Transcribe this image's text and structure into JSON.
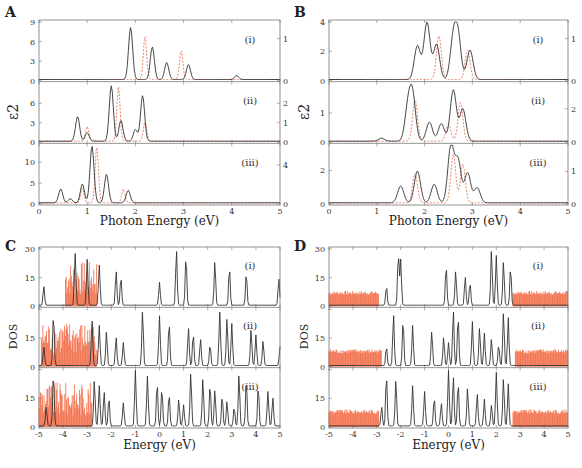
{
  "figure": {
    "panels": {
      "A": {
        "label": "A",
        "xlabel": "Photon Energy (eV)",
        "ylabel": "ε2"
      },
      "B": {
        "label": "B",
        "xlabel": "Photon Energy (eV)",
        "ylabel": "ε2"
      },
      "C": {
        "label": "C",
        "xlabel": "Energy (eV)",
        "ylabel": "DOS"
      },
      "D": {
        "label": "D",
        "xlabel": "Energy (eV)",
        "ylabel": "DOS"
      }
    },
    "sublabels": [
      "(i)",
      "(ii)",
      "(iii)"
    ],
    "colors": {
      "primary_line": "#333333",
      "secondary_line": "#e8775a",
      "dos_fill": "#f0582e"
    }
  },
  "chart_data": [
    {
      "panel": "A",
      "type": "line",
      "xlabel": "Photon Energy (eV)",
      "ylabel": "ε2",
      "xlim": [
        0,
        5
      ],
      "xticks": [
        0,
        1,
        2,
        3,
        4,
        5
      ],
      "subplots": [
        {
          "label": "(i)",
          "left_ylim": [
            0,
            9
          ],
          "left_yticks": [
            0,
            3,
            6,
            9
          ],
          "right_ylim": [
            0,
            1.4
          ],
          "right_yticks": [
            0,
            1
          ],
          "series": [
            {
              "name": "solid (left axis)",
              "style": "solid black",
              "peaks": [
                {
                  "x": 1.9,
                  "y": 8.0
                },
                {
                  "x": 2.35,
                  "y": 5.0
                },
                {
                  "x": 2.65,
                  "y": 2.6
                },
                {
                  "x": 3.1,
                  "y": 2.3
                },
                {
                  "x": 4.1,
                  "y": 0.6
                }
              ]
            },
            {
              "name": "dashed (right axis)",
              "style": "dashed red",
              "peaks": [
                {
                  "x": 2.2,
                  "y": 1.05
                },
                {
                  "x": 2.95,
                  "y": 0.7
                }
              ]
            }
          ]
        },
        {
          "label": "(ii)",
          "left_ylim": [
            0,
            9
          ],
          "left_yticks": [
            0,
            3,
            6
          ],
          "right_ylim": [
            0,
            3
          ],
          "right_yticks": [
            0,
            1,
            2
          ],
          "series": [
            {
              "name": "solid (left axis)",
              "style": "solid black",
              "peaks": [
                {
                  "x": 0.8,
                  "y": 3.8
                },
                {
                  "x": 1.0,
                  "y": 1.3
                },
                {
                  "x": 1.5,
                  "y": 8.5
                },
                {
                  "x": 1.7,
                  "y": 3.2
                },
                {
                  "x": 2.0,
                  "y": 1.8
                },
                {
                  "x": 2.15,
                  "y": 7.0
                }
              ]
            },
            {
              "name": "dashed (right axis)",
              "style": "dashed red",
              "peaks": [
                {
                  "x": 1.0,
                  "y": 0.75
                },
                {
                  "x": 1.65,
                  "y": 2.8
                },
                {
                  "x": 2.2,
                  "y": 1.0
                }
              ]
            }
          ]
        },
        {
          "label": "(iii)",
          "left_ylim": [
            0,
            14
          ],
          "left_yticks": [
            0,
            5,
            10
          ],
          "right_ylim": [
            0,
            6
          ],
          "right_yticks": [
            0,
            4
          ],
          "series": [
            {
              "name": "solid (left axis)",
              "style": "solid black",
              "peaks": [
                {
                  "x": 0.45,
                  "y": 3.3
                },
                {
                  "x": 0.65,
                  "y": 1.0
                },
                {
                  "x": 0.9,
                  "y": 4.5
                },
                {
                  "x": 1.1,
                  "y": 13.5
                },
                {
                  "x": 1.4,
                  "y": 6.8
                },
                {
                  "x": 1.85,
                  "y": 3.0
                }
              ]
            },
            {
              "name": "dashed (right axis)",
              "style": "dashed red",
              "peaks": [
                {
                  "x": 0.9,
                  "y": 1.5
                },
                {
                  "x": 1.2,
                  "y": 5.8
                },
                {
                  "x": 1.75,
                  "y": 1.4
                }
              ]
            }
          ]
        }
      ]
    },
    {
      "panel": "B",
      "type": "line",
      "xlabel": "Photon Energy (eV)",
      "ylabel": "ε2",
      "xlim": [
        0,
        5
      ],
      "xticks": [
        0,
        1,
        2,
        3,
        4,
        5
      ],
      "subplots": [
        {
          "label": "(i)",
          "left_ylim": [
            0,
            4
          ],
          "left_yticks": [
            0,
            2,
            4
          ],
          "right_ylim": [
            0,
            1.4
          ],
          "right_yticks": [
            0,
            1
          ],
          "series": [
            {
              "name": "solid (left axis)",
              "style": "solid black",
              "peaks": [
                {
                  "x": 1.85,
                  "y": 2.3
                },
                {
                  "x": 2.05,
                  "y": 3.9
                },
                {
                  "x": 2.25,
                  "y": 2.4
                },
                {
                  "x": 2.6,
                  "y": 2.7
                },
                {
                  "x": 2.7,
                  "y": 2.8
                },
                {
                  "x": 2.95,
                  "y": 2.0
                }
              ]
            },
            {
              "name": "dashed (right axis)",
              "style": "dashed red",
              "peaks": [
                {
                  "x": 2.3,
                  "y": 1.05
                },
                {
                  "x": 2.9,
                  "y": 0.7
                }
              ]
            }
          ]
        },
        {
          "label": "(ii)",
          "left_ylim": [
            0,
            2
          ],
          "left_yticks": [
            0,
            1
          ],
          "right_ylim": [
            0,
            3.5
          ],
          "right_yticks": [
            0,
            2
          ],
          "series": [
            {
              "name": "solid (left axis)",
              "style": "solid black",
              "peaks": [
                {
                  "x": 1.1,
                  "y": 0.1
                },
                {
                  "x": 1.65,
                  "y": 1.1
                },
                {
                  "x": 1.75,
                  "y": 1.5
                },
                {
                  "x": 2.1,
                  "y": 0.65
                },
                {
                  "x": 2.35,
                  "y": 0.6
                },
                {
                  "x": 2.6,
                  "y": 1.75
                },
                {
                  "x": 2.8,
                  "y": 1.1
                }
              ]
            },
            {
              "name": "dashed (right axis)",
              "style": "dashed red",
              "peaks": [
                {
                  "x": 1.8,
                  "y": 2.5
                },
                {
                  "x": 2.5,
                  "y": 1.0
                },
                {
                  "x": 2.75,
                  "y": 2.3
                }
              ]
            }
          ]
        },
        {
          "label": "(iii)",
          "left_ylim": [
            0,
            3.5
          ],
          "left_yticks": [
            0,
            2
          ],
          "right_ylim": [
            0,
            1.8
          ],
          "right_yticks": [
            0,
            1
          ],
          "series": [
            {
              "name": "solid (left axis)",
              "style": "solid black",
              "peaks": [
                {
                  "x": 1.5,
                  "y": 1.0
                },
                {
                  "x": 1.85,
                  "y": 1.9
                },
                {
                  "x": 2.2,
                  "y": 1.1
                },
                {
                  "x": 2.55,
                  "y": 3.4
                },
                {
                  "x": 2.7,
                  "y": 2.5
                },
                {
                  "x": 2.9,
                  "y": 1.8
                },
                {
                  "x": 3.1,
                  "y": 0.9
                }
              ]
            },
            {
              "name": "dashed (right axis)",
              "style": "dashed red",
              "peaks": [
                {
                  "x": 1.8,
                  "y": 0.9
                },
                {
                  "x": 2.6,
                  "y": 1.5
                },
                {
                  "x": 2.8,
                  "y": 1.2
                }
              ]
            }
          ]
        }
      ]
    },
    {
      "panel": "C",
      "type": "line",
      "xlabel": "Energy (eV)",
      "ylabel": "DOS",
      "xlim": [
        -5,
        5
      ],
      "xticks": [
        -5,
        -4,
        -3,
        -2,
        -1,
        0,
        1,
        2,
        3,
        4,
        5
      ],
      "ylim": [
        0,
        30
      ],
      "yticks": [
        0,
        15,
        30
      ],
      "subplots": [
        {
          "label": "(i)",
          "solid_peaks_x": [
            -4.8,
            -3.5,
            -3.0,
            -2.5,
            -1.8,
            -1.6,
            0.0,
            0.7,
            1.1,
            2.3,
            2.9,
            3.6,
            4.95
          ],
          "red_fill_range": [
            -3.9,
            -2.6
          ]
        },
        {
          "label": "(ii)",
          "solid_peaks_x": [
            -4.8,
            -4.4,
            -2.8,
            -2.5,
            -2.2,
            -1.8,
            -1.5,
            -0.7,
            0.0,
            0.4,
            1.2,
            1.4,
            1.7,
            2.1,
            2.5,
            2.8,
            3.0,
            3.8,
            4.0,
            4.3,
            5.0
          ],
          "red_fill_range": [
            -4.9,
            -2.6
          ]
        },
        {
          "label": "(iii)",
          "solid_peaks_x": [
            -4.7,
            -4.4,
            -2.7,
            -2.5,
            -2.3,
            -2.1,
            -1.5,
            -1.0,
            -0.5,
            -0.1,
            0.1,
            0.4,
            0.8,
            1.0,
            1.3,
            1.8,
            2.1,
            2.3,
            2.6,
            2.8,
            3.1,
            3.3,
            3.6,
            4.1,
            4.5,
            4.7
          ],
          "red_fill_range": [
            -5.0,
            -2.8
          ]
        }
      ]
    },
    {
      "panel": "D",
      "type": "line",
      "xlabel": "Energy (eV)",
      "ylabel": "DOS",
      "xlim": [
        -5,
        5
      ],
      "xticks": [
        -5,
        -4,
        -3,
        -2,
        -1,
        0,
        1,
        2,
        3,
        4,
        5
      ],
      "ylim": [
        0,
        30
      ],
      "yticks": [
        0,
        15,
        30
      ],
      "subplots": [
        {
          "label": "(i)",
          "solid_peaks_x": [
            -2.6,
            -2.1,
            -2.0,
            -0.1,
            0.3,
            0.7,
            0.9,
            1.8,
            2.0,
            2.3,
            2.6
          ],
          "red_fill_ranges": [
            [
              -5.0,
              -2.9
            ],
            [
              2.7,
              5.0
            ]
          ],
          "red_band_height": 7
        },
        {
          "label": "(ii)",
          "solid_peaks_x": [
            -2.6,
            -2.3,
            -1.9,
            -1.5,
            -0.7,
            -0.2,
            0.0,
            0.2,
            0.4,
            1.0,
            1.3,
            1.5,
            1.8,
            2.1,
            2.3,
            2.5
          ],
          "red_fill_ranges": [
            [
              -5.0,
              -2.8
            ],
            [
              2.8,
              5.0
            ]
          ],
          "red_band_height": 8
        },
        {
          "label": "(iii)",
          "solid_peaks_x": [
            -2.8,
            -2.6,
            -2.2,
            -1.5,
            -1.0,
            -0.6,
            -0.3,
            0.0,
            0.2,
            0.4,
            0.8,
            1.2,
            1.5,
            1.8,
            2.0,
            2.3,
            2.5
          ],
          "red_fill_ranges": [
            [
              -5.0,
              -2.9
            ],
            [
              2.7,
              5.0
            ]
          ],
          "red_band_height": 8
        }
      ]
    }
  ]
}
